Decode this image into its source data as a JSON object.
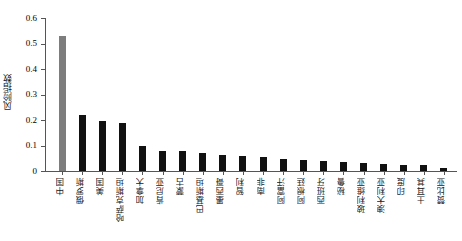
{
  "chart_data": {
    "type": "bar",
    "title": "",
    "xlabel": "",
    "ylabel": "风险指数",
    "ylim": [
      0,
      0.6
    ],
    "ytick_labels": [
      "0",
      "0.1",
      "0.2",
      "0.3",
      "0.4",
      "0.5",
      "0.6"
    ],
    "ytick_values": [
      0,
      0.1,
      0.2,
      0.3,
      0.4,
      0.5,
      0.6
    ],
    "grid": false,
    "legend": null,
    "highlight_index": 0,
    "highlight_color": "#7d7d7d",
    "bar_color": "#111111",
    "categories": [
      "中国",
      "俄罗斯",
      "美国",
      "哈萨克斯坦",
      "加拿大",
      "肯尼亚",
      "蒙古",
      "巴基斯坦",
      "墨西哥",
      "智利",
      "南非",
      "阿富汗",
      "阿根廷",
      "西班牙",
      "秘鲁",
      "玻利维亚",
      "澳大利亚",
      "印度",
      "土耳其",
      "赞比亚"
    ],
    "values": [
      0.53,
      0.22,
      0.195,
      0.19,
      0.1,
      0.079,
      0.077,
      0.07,
      0.062,
      0.06,
      0.056,
      0.048,
      0.044,
      0.041,
      0.034,
      0.031,
      0.028,
      0.024,
      0.022,
      0.012
    ]
  }
}
